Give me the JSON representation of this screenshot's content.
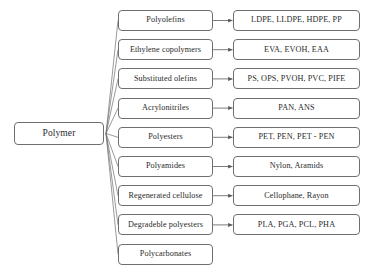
{
  "diagram": {
    "root": {
      "label": "Polymer"
    },
    "style": {
      "box_border_color": "#6f6f6f",
      "box_fill_color": "#ffffff",
      "text_color": "#2a2a2a",
      "connector_color": "#6f6f6f",
      "background_color": "#ffffff"
    },
    "branches": [
      {
        "category": "Polyolefins",
        "examples": "LDPE,  LLDPE,  HDPE,  PP",
        "has_examples": true
      },
      {
        "category": "Ethylene copolymers",
        "examples": "EVA, EVOH, EAA",
        "has_examples": true
      },
      {
        "category": "Substituted olefins",
        "examples": "PS,  OPS,  PVOH, PVC,  PIFE",
        "has_examples": true
      },
      {
        "category": "Acrylonitriles",
        "examples": "PAN, ANS",
        "has_examples": true
      },
      {
        "category": "Polyesters",
        "examples": "PET,  PEN, PET - PEN",
        "has_examples": true
      },
      {
        "category": "Polyamides",
        "examples": "Nylon, Aramids",
        "has_examples": true
      },
      {
        "category": "Regenerated cellulose",
        "examples": "Cellophane, Rayon",
        "has_examples": true
      },
      {
        "category": "Degradeble polyesters",
        "examples": "PLA, PGA,  PCL,  PHA",
        "has_examples": true
      },
      {
        "category": "Polycarbonates",
        "examples": "",
        "has_examples": false
      }
    ]
  }
}
